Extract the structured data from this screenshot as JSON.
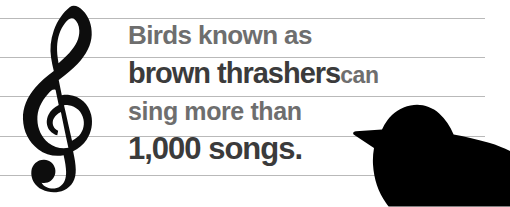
{
  "canvas": {
    "width": 510,
    "height": 207,
    "background_color": "#ffffff"
  },
  "staff": {
    "name": "music-staff",
    "line_count": 5,
    "line_color": "#b9b9b9",
    "clef": "treble-clef",
    "clef_color": "#000000"
  },
  "fact": {
    "line1": "Birds known as",
    "line2_emphasis": "brown thrashers",
    "line2_plain": "can",
    "line3": "sing more than",
    "line4": "1,000 songs.",
    "full_text": "Birds known as brown thrashers can sing more than 1,000 songs.",
    "emphasis_color": "#3b3b3b",
    "plain_color": "#6e6e6e"
  },
  "illustration": {
    "bird_label": "brown-thrasher-silhouette",
    "bird_color": "#000000"
  }
}
